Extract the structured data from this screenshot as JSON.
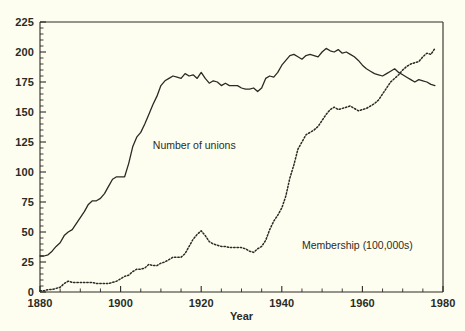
{
  "chart_data": {
    "type": "line",
    "title": "",
    "xlabel": "Year",
    "ylabel": "",
    "xlim": [
      1880,
      1980
    ],
    "ylim": [
      0,
      225
    ],
    "grid": false,
    "legend_position": "inline-annotations",
    "x_major_ticks": [
      1880,
      1900,
      1920,
      1940,
      1960,
      1980
    ],
    "x_major_tick_labels": [
      "1880",
      "1900",
      "1920",
      "1940",
      "1960",
      "1980"
    ],
    "x_minor_tick_step": 5,
    "y_major_ticks": [
      0,
      25,
      50,
      75,
      100,
      125,
      150,
      175,
      200,
      225
    ],
    "y_major_tick_labels": [
      "0",
      "25",
      "50",
      "75",
      "100",
      "125",
      "150",
      "175",
      "200",
      "225"
    ],
    "y_minor_tick_step": 5,
    "series": [
      {
        "name": "Number of unions",
        "style": "solid",
        "color": "#2b2b26",
        "label_x": 1908,
        "label_y": 122,
        "x": [
          1880,
          1881,
          1882,
          1883,
          1884,
          1885,
          1886,
          1887,
          1888,
          1889,
          1890,
          1891,
          1892,
          1893,
          1894,
          1895,
          1896,
          1897,
          1898,
          1899,
          1900,
          1901,
          1902,
          1903,
          1904,
          1905,
          1906,
          1907,
          1908,
          1909,
          1910,
          1911,
          1912,
          1913,
          1914,
          1915,
          1916,
          1917,
          1918,
          1919,
          1920,
          1921,
          1922,
          1923,
          1924,
          1925,
          1926,
          1927,
          1928,
          1929,
          1930,
          1931,
          1932,
          1933,
          1934,
          1935,
          1936,
          1937,
          1938,
          1939,
          1940,
          1941,
          1942,
          1943,
          1944,
          1945,
          1946,
          1947,
          1948,
          1949,
          1950,
          1951,
          1952,
          1953,
          1954,
          1955,
          1956,
          1957,
          1958,
          1959,
          1960,
          1961,
          1962,
          1963,
          1964,
          1965,
          1966,
          1967,
          1968,
          1969,
          1970,
          1971,
          1972,
          1973,
          1974,
          1975,
          1976,
          1977,
          1978
        ],
        "values": [
          30,
          30,
          31,
          34,
          38,
          41,
          47,
          50,
          52,
          57,
          62,
          67,
          73,
          76,
          76,
          78,
          82,
          88,
          94,
          96,
          96,
          96,
          107,
          121,
          129,
          133,
          140,
          148,
          156,
          163,
          172,
          176,
          178,
          180,
          179,
          178,
          182,
          180,
          181,
          178,
          183,
          178,
          174,
          176,
          175,
          172,
          174,
          172,
          172,
          172,
          170,
          169,
          169,
          170,
          167,
          170,
          178,
          180,
          179,
          183,
          189,
          193,
          197,
          198,
          196,
          194,
          197,
          198,
          197,
          196,
          200,
          203,
          201,
          200,
          202,
          199,
          200,
          198,
          196,
          193,
          189,
          186,
          184,
          182,
          181,
          180,
          182,
          184,
          186,
          183,
          181,
          179,
          177,
          175,
          177,
          176,
          175,
          173,
          172
        ]
      },
      {
        "name": "Membership (100,000s)",
        "style": "dotted",
        "color": "#2b2b26",
        "label_x": 1945,
        "label_y": 38,
        "x": [
          1880,
          1881,
          1882,
          1883,
          1884,
          1885,
          1886,
          1887,
          1888,
          1889,
          1890,
          1891,
          1892,
          1893,
          1894,
          1895,
          1896,
          1897,
          1898,
          1899,
          1900,
          1901,
          1902,
          1903,
          1904,
          1905,
          1906,
          1907,
          1908,
          1909,
          1910,
          1911,
          1912,
          1913,
          1914,
          1915,
          1916,
          1917,
          1918,
          1919,
          1920,
          1921,
          1922,
          1923,
          1924,
          1925,
          1926,
          1927,
          1928,
          1929,
          1930,
          1931,
          1932,
          1933,
          1934,
          1935,
          1936,
          1937,
          1938,
          1939,
          1940,
          1941,
          1942,
          1943,
          1944,
          1945,
          1946,
          1947,
          1948,
          1949,
          1950,
          1951,
          1952,
          1953,
          1954,
          1955,
          1956,
          1957,
          1958,
          1959,
          1960,
          1961,
          1962,
          1963,
          1964,
          1965,
          1966,
          1967,
          1968,
          1969,
          1970,
          1971,
          1972,
          1973,
          1974,
          1975,
          1976,
          1977,
          1978
        ],
        "values": [
          1,
          1,
          2,
          2,
          3,
          4,
          7,
          9,
          8,
          8,
          8,
          8,
          8,
          8,
          7,
          7,
          7,
          7,
          8,
          9,
          11,
          13,
          14,
          17,
          19,
          19,
          20,
          23,
          22,
          22,
          24,
          25,
          27,
          29,
          29,
          29,
          32,
          38,
          44,
          48,
          51,
          47,
          42,
          40,
          39,
          38,
          38,
          37,
          37,
          37,
          37,
          36,
          34,
          33,
          36,
          38,
          43,
          52,
          59,
          64,
          70,
          80,
          95,
          106,
          119,
          125,
          131,
          133,
          135,
          138,
          143,
          148,
          152,
          154,
          152,
          153,
          154,
          155,
          153,
          151,
          152,
          153,
          155,
          157,
          160,
          165,
          170,
          175,
          178,
          181,
          185,
          188,
          190,
          191,
          192,
          196,
          199,
          198,
          203
        ]
      }
    ]
  },
  "axis": {
    "x_title": "Year"
  }
}
